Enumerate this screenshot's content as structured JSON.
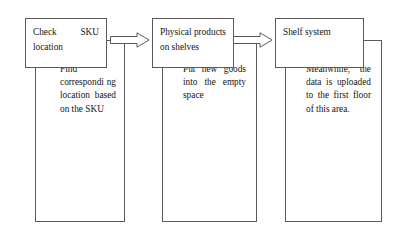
{
  "diagram": {
    "type": "flowchart",
    "line_color": "#5a5a5a",
    "text_color": "#141414",
    "background": "#ffffff",
    "stages": [
      {
        "id": "stage-1",
        "step_label": "Check SKU location",
        "detail_label": "Find correspondi ng location based on the SKU"
      },
      {
        "id": "stage-2",
        "step_label": "Physical products on shelves",
        "detail_label": "Put new goods into the empty space"
      },
      {
        "id": "stage-3",
        "step_label": "Shelf system",
        "detail_label": "Meanwhile, the data is uploaded to the first floor of this area."
      }
    ],
    "connectors": [
      {
        "id": "arrow-1",
        "name": "block-arrow-right",
        "from": "stage-1",
        "to": "stage-2"
      },
      {
        "id": "arrow-2",
        "name": "block-arrow-right",
        "from": "stage-2",
        "to": "stage-3"
      }
    ]
  }
}
